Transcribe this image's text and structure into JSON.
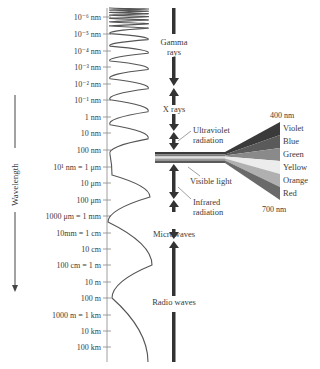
{
  "axis": {
    "title": "Wavelength",
    "ticks": [
      {
        "label": "10⁻⁶ nm",
        "y": 17
      },
      {
        "label": "10⁻⁵ nm",
        "y": 34
      },
      {
        "label": "10⁻⁴ nm",
        "y": 51
      },
      {
        "label": "10⁻³ nm",
        "y": 67
      },
      {
        "label": "10⁻² nm",
        "y": 84
      },
      {
        "label": "10⁻¹ nm",
        "y": 100
      },
      {
        "label": "1 nm",
        "y": 117
      },
      {
        "label": "10 nm",
        "y": 133
      },
      {
        "label": "100 nm",
        "y": 150
      },
      {
        "label": "10¹ nm = 1 μm",
        "y": 167
      },
      {
        "label": "10 μm",
        "y": 183
      },
      {
        "label": "100 μm",
        "y": 200
      },
      {
        "label": "1000 μm = 1 mm",
        "y": 216
      },
      {
        "label": "10mm = 1 cm",
        "y": 233
      },
      {
        "label": "10 cm",
        "y": 249
      },
      {
        "label": "100 cm = 1 m",
        "y": 265
      },
      {
        "label": "10 m",
        "y": 282
      },
      {
        "label": "100 m",
        "y": 298
      },
      {
        "label": "1000 m = 1 km",
        "y": 315
      },
      {
        "label": "10 km",
        "y": 331
      },
      {
        "label": "100 km",
        "y": 347
      }
    ]
  },
  "regions": {
    "gamma": {
      "line1": "Gamma",
      "line2": "rays"
    },
    "xrays": {
      "line1": "X rays"
    },
    "ultraviolet": {
      "line1": "Ultraviolet",
      "line2": "radiation"
    },
    "visible": {
      "line1": "Visible light"
    },
    "infrared": {
      "line1": "Infrared",
      "line2": "radiation"
    },
    "microwaves": {
      "line1": "Microwaves"
    },
    "radio": {
      "line1": "Radio waves"
    }
  },
  "visible_spectrum": {
    "top_label": "400 nm",
    "bottom_label": "700 nm",
    "bands": [
      {
        "name": "Violet",
        "color": "#3a3a3a"
      },
      {
        "name": "Blue",
        "color": "#5a5a5a"
      },
      {
        "name": "Green",
        "color": "#8a8a8a"
      },
      {
        "name": "Yellow",
        "color": "#e8e8e8"
      },
      {
        "name": "Orange",
        "color": "#b0b0b0"
      },
      {
        "name": "Red",
        "color": "#6a6a6a"
      }
    ]
  }
}
